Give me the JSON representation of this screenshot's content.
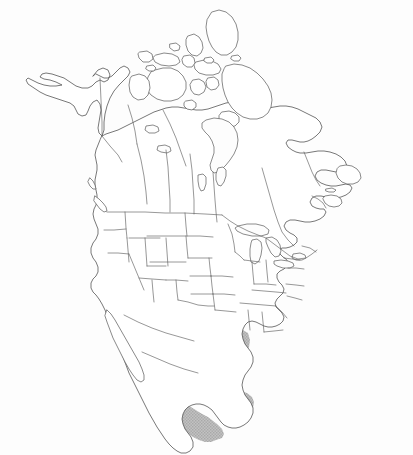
{
  "figure": {
    "type": "range-map",
    "width_px": 413,
    "height_px": 455,
    "background_color": "#fdfdfd",
    "outline_color": "#555555",
    "has_labels": false,
    "has_legend": false,
    "has_scale_bar": false,
    "has_graticule": false,
    "projection_appearance": "conic"
  },
  "range_overlay": {
    "name": "shaded-distribution-range",
    "fill_color": "#c2c2c2",
    "pattern": "fine-stipple-halftone",
    "opacity": 1,
    "regions_covered": [
      "Mexico (mainland)",
      "Yucatan Peninsula",
      "southern California",
      "southern Arizona",
      "southern New Mexico",
      "southern and western Texas"
    ],
    "regions_excluded": [
      "Baja California peninsula",
      "eastern Texas",
      "all of Canada",
      "northern and eastern United States"
    ]
  },
  "map_features": {
    "countries": [
      "Canada",
      "United States",
      "Mexico"
    ],
    "major_water_bodies": [
      "Hudson Bay",
      "James Bay",
      "Gulf of Mexico",
      "Great Lakes",
      "Gulf of California"
    ],
    "notable_landforms": [
      "Alaska",
      "Canadian Arctic Archipelago",
      "Baffin Island",
      "Ellesmere Island",
      "Victoria Island",
      "Newfoundland",
      "Nova Scotia",
      "Vancouver Island",
      "Florida Peninsula",
      "Baja California",
      "Yucatan Peninsula"
    ]
  },
  "chart_data": {
    "type": "map",
    "categories": [
      "In range (shaded)",
      "Out of range (white)"
    ],
    "values": [
      1,
      0
    ],
    "legend_entries": [
      {
        "label": "In range",
        "color": "#c2c2c2"
      },
      {
        "label": "Out of range",
        "color": "#ffffff"
      }
    ]
  }
}
